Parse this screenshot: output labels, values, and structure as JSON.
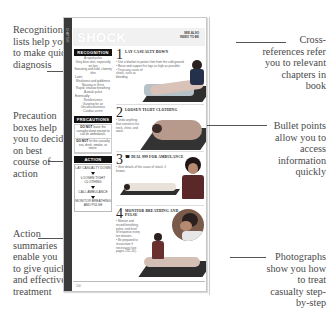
{
  "callouts": {
    "recognition": "Recognition lists help you to make quick diagnosis",
    "precaution": "Precaution boxes help you to decide on best course of action",
    "action": "Action summaries enable you to give quick and effective treatment",
    "crossref": "Cross-references refer you to relevant chapters in book",
    "bullets": "Bullet points allow you to access information quickly",
    "photos": "Photographs show you how to treat casualty step-by-step"
  },
  "page": {
    "banner_title": "SHOCK",
    "side_tab": "CHAPTER",
    "crossref_text": "SEE ALSO\nINDEX TO BE",
    "page_number": "240",
    "recognition": {
      "heading": "RECOGNITION",
      "items": [
        {
          "text": "A rapid pulse",
          "sub": false
        },
        {
          "text": "Grey-blue skin, especially on lips",
          "sub": false
        },
        {
          "text": "Sweating and cold, clammy skin",
          "sub": false
        },
        {
          "text": "Later:",
          "sub": true
        },
        {
          "text": "Weakness and giddiness",
          "sub": false
        },
        {
          "text": "Nausea or thirst",
          "sub": false
        },
        {
          "text": "Rapid, shallow breathing",
          "sub": false
        },
        {
          "text": "A weak pulse",
          "sub": false
        },
        {
          "text": "Eventually:",
          "sub": true
        },
        {
          "text": "Restlessness",
          "sub": false
        },
        {
          "text": "Gasping for air",
          "sub": false
        },
        {
          "text": "Unconsciousness",
          "sub": false
        },
        {
          "text": "Cardiac arrest",
          "sub": false
        }
      ]
    },
    "precautions": {
      "heading": "PRECAUTIONS",
      "items": [
        {
          "bold": "DO NOT",
          "text": " leave the casualty alone except to call an ambulance."
        },
        {
          "bold": "DO NOT",
          "text": " let the casualty eat, drink, smoke, or move."
        }
      ]
    },
    "action": {
      "heading": "ACTION",
      "steps": [
        "LAY CASUALTY DOWN",
        "LOOSEN TIGHT CLOTHING",
        "CALL AMBULANCE",
        "MONITOR BREATHING AND PULSE"
      ]
    },
    "steps": [
      {
        "number": "1",
        "title": "LAY CASUALTY DOWN",
        "text": [
          "• Use a blanket to protect him from the cold ground.",
          "• Raise and support his legs as high as possible.",
          "• Treat any cause of shock, such as bleeding."
        ]
      },
      {
        "number": "2",
        "title": "LOOSEN TIGHT CLOTHING",
        "text": [
          "• Undo anything that constricts his neck, chest, and waist."
        ]
      },
      {
        "number": "3",
        "title": "☎ DIAL 999 FOR AMBULANCE",
        "text": [
          "• Give details of the cause of shock, if known."
        ]
      },
      {
        "number": "4",
        "title": "MONITOR BREATHING AND PULSE",
        "text": [
          "• Monitor and record breathing, pulse, and level of response every ten minutes.",
          "• Be prepared to resuscitate if necessary (see pages 232–41)."
        ]
      }
    ]
  }
}
